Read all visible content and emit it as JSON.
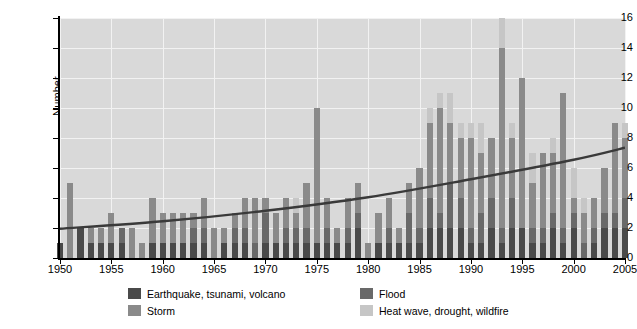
{
  "chart_data": {
    "type": "bar",
    "subtype": "stacked-bar-with-trendline",
    "title": "",
    "xlabel": "",
    "ylabel": "Number",
    "ylim": [
      0,
      16
    ],
    "ytick_values": [
      0,
      2,
      4,
      6,
      8,
      10,
      12,
      14,
      16
    ],
    "xlim": [
      1950,
      2005
    ],
    "xtick_values": [
      1950,
      1955,
      1960,
      1965,
      1970,
      1975,
      1980,
      1985,
      1990,
      1995,
      2000,
      2005
    ],
    "grid": true,
    "grid_color": "#f2f2f2",
    "plot_background": "#d9d9d9",
    "legend_position": "below-axes",
    "series": [
      {
        "name": "Earthquake, tsunami, volcano",
        "color": "#4a4a4a",
        "values": [
          1,
          0,
          2,
          1,
          1,
          1,
          1,
          0,
          0,
          1,
          1,
          1,
          1,
          1,
          1,
          0,
          1,
          1,
          1,
          0,
          1,
          1,
          1,
          1,
          1,
          1,
          1,
          1,
          1,
          2,
          0,
          1,
          1,
          1,
          1,
          1,
          2,
          2,
          2,
          2,
          1,
          1,
          2,
          1,
          2,
          2,
          1,
          1,
          2,
          1,
          2,
          0,
          1,
          2,
          2,
          2
        ]
      },
      {
        "name": "Storm",
        "color": "#8a8a8a",
        "values": [
          0,
          5,
          0,
          1,
          1,
          2,
          0,
          2,
          1,
          3,
          2,
          2,
          2,
          1,
          2,
          2,
          1,
          1,
          2,
          3,
          1,
          2,
          2,
          1,
          3,
          9,
          2,
          1,
          2,
          2,
          1,
          2,
          2,
          1,
          2,
          4,
          5,
          7,
          4,
          4,
          6,
          4,
          4,
          12,
          4,
          10,
          3,
          5,
          4,
          9,
          1,
          2,
          2,
          3,
          6,
          4
        ]
      },
      {
        "name": "Flood",
        "color": "#696969",
        "values": [
          0,
          0,
          0,
          0,
          0,
          0,
          1,
          0,
          0,
          0,
          0,
          0,
          0,
          1,
          1,
          0,
          0,
          1,
          1,
          1,
          2,
          0,
          1,
          1,
          1,
          0,
          1,
          0,
          1,
          1,
          0,
          0,
          1,
          0,
          2,
          1,
          2,
          1,
          3,
          2,
          1,
          2,
          2,
          1,
          2,
          0,
          1,
          1,
          1,
          1,
          1,
          1,
          1,
          1,
          1,
          2
        ]
      },
      {
        "name": "Heat wave, drought, wildfire",
        "color": "#c6c6c6",
        "values": [
          0,
          0,
          0,
          0,
          0,
          0,
          0,
          0,
          0,
          0,
          0,
          0,
          0,
          0,
          0,
          0,
          0,
          0,
          0,
          0,
          0,
          0,
          0,
          1,
          0,
          0,
          0,
          0,
          0,
          0,
          0,
          0,
          0,
          0,
          0,
          0,
          1,
          1,
          2,
          1,
          1,
          2,
          0,
          2,
          1,
          0,
          2,
          0,
          1,
          0,
          2,
          1,
          0,
          0,
          0,
          1
        ]
      }
    ],
    "x": [
      1950,
      1951,
      1952,
      1953,
      1954,
      1955,
      1956,
      1957,
      1958,
      1959,
      1960,
      1961,
      1962,
      1963,
      1964,
      1965,
      1966,
      1967,
      1968,
      1969,
      1970,
      1971,
      1972,
      1973,
      1974,
      1975,
      1976,
      1977,
      1978,
      1979,
      1980,
      1981,
      1982,
      1983,
      1984,
      1985,
      1986,
      1987,
      1988,
      1989,
      1990,
      1991,
      1992,
      1993,
      1994,
      1995,
      1996,
      1997,
      1998,
      1999,
      2000,
      2001,
      2002,
      2003,
      2004,
      2005
    ],
    "trendline": {
      "type": "polynomial",
      "color": "#3a3a3a",
      "points": [
        {
          "x": 1950,
          "y": 1.95
        },
        {
          "x": 1960,
          "y": 2.45
        },
        {
          "x": 1970,
          "y": 3.15
        },
        {
          "x": 1980,
          "y": 4.05
        },
        {
          "x": 1990,
          "y": 5.25
        },
        {
          "x": 2000,
          "y": 6.55
        },
        {
          "x": 2005,
          "y": 7.35
        }
      ]
    }
  },
  "legend": {
    "items": [
      {
        "label": "Earthquake, tsunami, volcano",
        "color": "#4a4a4a"
      },
      {
        "label": "Flood",
        "color": "#696969"
      },
      {
        "label": "Storm",
        "color": "#8a8a8a"
      },
      {
        "label": "Heat wave, drought, wildfire",
        "color": "#c6c6c6"
      }
    ]
  },
  "axes": {
    "ylabel": "Number",
    "ytick_labels": [
      "16",
      "14",
      "12",
      "10",
      "8",
      "6",
      "4",
      "2",
      "0"
    ],
    "xtick_labels": [
      "1950",
      "1955",
      "1960",
      "1965",
      "1970",
      "1975",
      "1980",
      "1985",
      "1990",
      "1995",
      "2000",
      "2005"
    ]
  }
}
